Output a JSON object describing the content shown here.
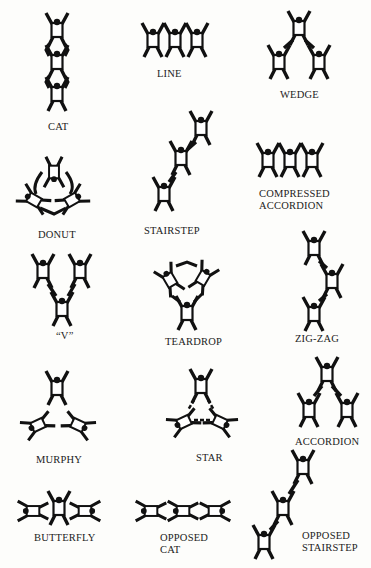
{
  "diagram": {
    "type": "formation-catalog",
    "formations": [
      {
        "id": "cat",
        "label": "CAT",
        "lines": [
          "CAT"
        ]
      },
      {
        "id": "line",
        "label": "LINE",
        "lines": [
          "LINE"
        ]
      },
      {
        "id": "wedge",
        "label": "WEDGE",
        "lines": [
          "WEDGE"
        ]
      },
      {
        "id": "donut",
        "label": "DONUT",
        "lines": [
          "DONUT"
        ]
      },
      {
        "id": "stairstep",
        "label": "STAIRSTEP",
        "lines": [
          "STAIRSTEP"
        ]
      },
      {
        "id": "compressed-accordion",
        "label": "COMPRESSED ACCORDION",
        "lines": [
          "COMPRESSED",
          "ACCORDION"
        ]
      },
      {
        "id": "v",
        "label": "“V”",
        "lines": [
          "“V”"
        ]
      },
      {
        "id": "teardrop",
        "label": "TEARDROP",
        "lines": [
          "TEARDROP"
        ]
      },
      {
        "id": "zig-zag",
        "label": "ZIG-ZAG",
        "lines": [
          "ZIG-ZAG"
        ]
      },
      {
        "id": "murphy",
        "label": "MURPHY",
        "lines": [
          "MURPHY"
        ]
      },
      {
        "id": "star",
        "label": "STAR",
        "lines": [
          "STAR"
        ]
      },
      {
        "id": "accordion",
        "label": "ACCORDION",
        "lines": [
          "ACCORDION"
        ]
      },
      {
        "id": "butterfly",
        "label": "BUTTERFLY",
        "lines": [
          "BUTTERFLY"
        ]
      },
      {
        "id": "opposed-cat",
        "label": "OPPOSED CAT",
        "lines": [
          "OPPOSED",
          "CAT"
        ]
      },
      {
        "id": "opposed-stairstep",
        "label": "OPPOSED STAIRSTEP",
        "lines": [
          "OPPOSED",
          "STAIRSTEP"
        ]
      }
    ]
  }
}
